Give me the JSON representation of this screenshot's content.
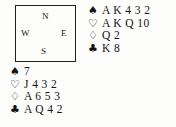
{
  "diagram": {
    "type": "bridge-hand-diagram",
    "background_color": "#fdfdfb",
    "ink_color": "#141414"
  },
  "compass": {
    "north_label": "N",
    "west_label": "W",
    "east_label": "E",
    "south_label": "S",
    "border_color": "#1f1f1f"
  },
  "suits": {
    "spade_symbol": "♠",
    "heart_symbol": "♡",
    "diamond_symbol": "♢",
    "club_symbol": "♣"
  },
  "hands": {
    "north": {
      "position_label": "North",
      "spades": "A K 4 3 2",
      "hearts": "A K Q 10",
      "diamonds": "Q 2",
      "clubs": "K 8"
    },
    "south": {
      "position_label": "South",
      "spades": "7",
      "hearts": "J 4 3 2",
      "diamonds": "A 6 5 3",
      "clubs": "A Q 4 2"
    }
  }
}
